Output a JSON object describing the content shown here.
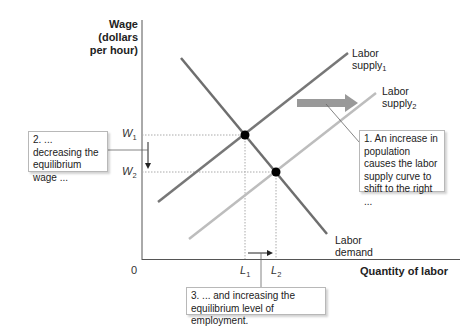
{
  "figure": {
    "y_axis_title": "Wage\n(dollars\nper hour)",
    "x_axis_title": "Quantity of labor",
    "origin_label": "0",
    "ticks": {
      "w1": {
        "base": "W",
        "sub": "1"
      },
      "w2": {
        "base": "W",
        "sub": "2"
      },
      "l1": {
        "base": "L",
        "sub": "1"
      },
      "l2": {
        "base": "L",
        "sub": "2"
      }
    },
    "curves": {
      "supply1": {
        "line1": "Labor",
        "line2": "supply",
        "sub": "1",
        "color": "#777777"
      },
      "supply2": {
        "line1": "Labor",
        "line2": "supply",
        "sub": "2",
        "color": "#bdbdbd"
      },
      "demand": {
        "line1": "Labor",
        "line2": "demand",
        "color": "#6e6e6e"
      }
    },
    "callouts": {
      "c1": "1. An increase in population causes the labor supply curve to shift to the right ...",
      "c2": "2. ... decreasing the equilibrium wage ...",
      "c3": "3. ... and increasing the equilibrium level of employment."
    },
    "shift_arrow_color": "#999999"
  }
}
